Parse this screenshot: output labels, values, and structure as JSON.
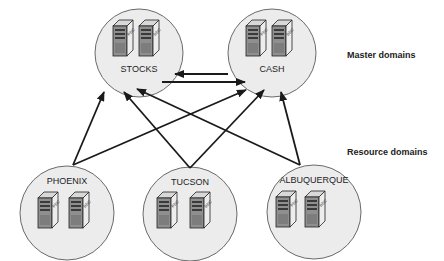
{
  "diagram": {
    "tiers": {
      "master": "Master domains",
      "resource": "Resource domains"
    },
    "domains": [
      {
        "id": "stocks",
        "name": "STOCKS",
        "tier": "master",
        "servers": [
          "PDC",
          "BDC"
        ]
      },
      {
        "id": "cash",
        "name": "CASH",
        "tier": "master",
        "servers": [
          "PDC",
          "BDC"
        ]
      },
      {
        "id": "phoenix",
        "name": "PHOENIX",
        "tier": "resource",
        "servers": [
          "PDC",
          "BDC"
        ]
      },
      {
        "id": "tucson",
        "name": "TUCSON",
        "tier": "resource",
        "servers": [
          "PDC",
          "BDC"
        ]
      },
      {
        "id": "albuquerque",
        "name": "ALBUQUERQUE",
        "tier": "resource",
        "servers": [
          "PDC",
          "BDC"
        ]
      }
    ],
    "trusts": [
      {
        "from": "cash",
        "to": "stocks"
      },
      {
        "from": "stocks",
        "to": "cash"
      },
      {
        "from": "phoenix",
        "to": "stocks"
      },
      {
        "from": "phoenix",
        "to": "cash"
      },
      {
        "from": "tucson",
        "to": "stocks"
      },
      {
        "from": "tucson",
        "to": "cash"
      },
      {
        "from": "albuquerque",
        "to": "stocks"
      },
      {
        "from": "albuquerque",
        "to": "cash"
      }
    ],
    "colors": {
      "circle_fill": "#ececec",
      "circle_stroke": "#6a6a6a",
      "arrow": "#1a1a1a",
      "server_front": "#9a9a9a",
      "server_side": "#e8e8e8"
    }
  }
}
